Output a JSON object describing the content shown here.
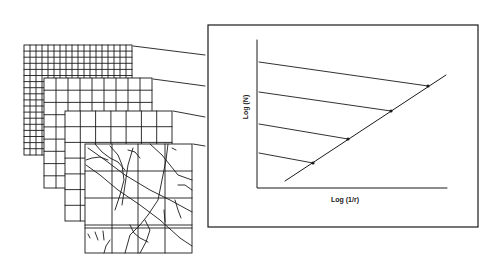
{
  "diagram": {
    "type": "box-counting fractal dimension illustration",
    "grids": [
      {
        "name": "grid-fine",
        "columns": 18,
        "rows": 18
      },
      {
        "name": "grid-medium",
        "columns": 9,
        "rows": 9
      },
      {
        "name": "grid-coarse",
        "columns": 7,
        "rows": 7
      },
      {
        "name": "grid-crack-pattern",
        "columns": 4,
        "rows": 4
      }
    ],
    "plot": {
      "xlabel": "Log (1/r)",
      "ylabel": "Log (N)",
      "points": 4,
      "fit_line": "linear"
    },
    "colors": {
      "line": "#1a1a1a",
      "background": "#ffffff"
    }
  }
}
